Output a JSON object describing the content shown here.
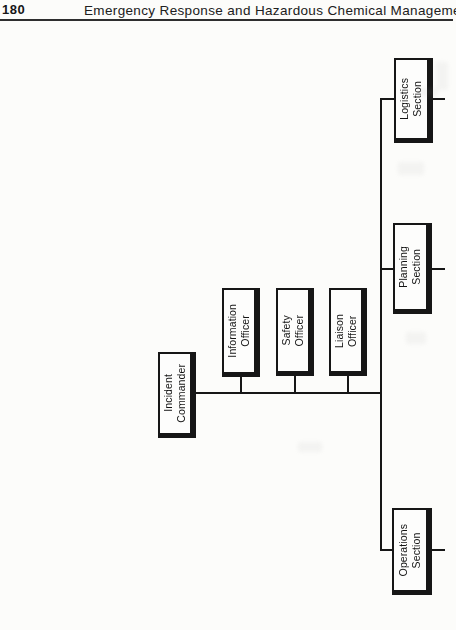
{
  "page": {
    "number": "180",
    "header_title": "Emergency Response and Hazardous Chemical Management"
  },
  "chart": {
    "type": "org-chart",
    "orientation": "rotated-90-counterclockwise",
    "nodes": [
      {
        "id": "incident-commander",
        "label": "Incident\nCommander",
        "role": "command"
      },
      {
        "id": "information-officer",
        "label": "Information\nOfficer",
        "role": "command-staff"
      },
      {
        "id": "safety-officer",
        "label": "Safety\nOfficer",
        "role": "command-staff"
      },
      {
        "id": "liaison-officer",
        "label": "Liaison\nOfficer",
        "role": "command-staff"
      },
      {
        "id": "logistics-section",
        "label": "Logistics\nSection",
        "role": "general-staff"
      },
      {
        "id": "planning-section",
        "label": "Planning\nSection",
        "role": "general-staff"
      },
      {
        "id": "operations-section",
        "label": "Operations\nSection",
        "role": "general-staff"
      }
    ],
    "edges": [
      {
        "from": "incident-commander",
        "to": "information-officer"
      },
      {
        "from": "incident-commander",
        "to": "safety-officer"
      },
      {
        "from": "incident-commander",
        "to": "liaison-officer"
      },
      {
        "from": "incident-commander",
        "to": "operations-section"
      },
      {
        "from": "incident-commander",
        "to": "planning-section"
      },
      {
        "from": "incident-commander",
        "to": "logistics-section"
      }
    ]
  }
}
